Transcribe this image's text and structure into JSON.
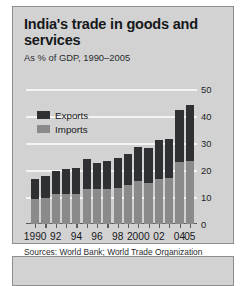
{
  "chart_data": {
    "type": "bar",
    "title": "India's trade in goods and services",
    "subtitle": "As % of GDP, 1990–2005",
    "xlabel": "",
    "ylabel": "",
    "ylim": [
      0,
      50
    ],
    "yticks": [
      0,
      10,
      20,
      30,
      40,
      50
    ],
    "grid": true,
    "stacked": true,
    "legend_position": "upper-left",
    "source": "Sources: World Bank; World Trade Organization",
    "categories": [
      1990,
      1991,
      1992,
      1993,
      1994,
      1995,
      1996,
      1997,
      1998,
      1999,
      2000,
      2001,
      2002,
      2003,
      2004,
      2005
    ],
    "tick_labels": [
      "1990",
      "",
      "92",
      "",
      "94",
      "",
      "96",
      "",
      "98",
      "",
      "2000",
      "",
      "02",
      "",
      "04",
      "05"
    ],
    "series": [
      {
        "name": "Imports",
        "color": "#8a8a8a",
        "values": [
          9.3,
          9.5,
          11.2,
          11.0,
          11.2,
          13.0,
          12.9,
          12.9,
          13.4,
          14.4,
          15.8,
          15.3,
          16.7,
          17.0,
          22.9,
          23.3
        ]
      },
      {
        "name": "Exports",
        "color": "#2e3033",
        "values": [
          7.4,
          8.4,
          8.6,
          9.3,
          9.4,
          10.9,
          9.7,
          10.4,
          10.9,
          11.6,
          12.7,
          13.0,
          14.5,
          14.4,
          19.3,
          20.8
        ]
      }
    ],
    "totals": [
      16.7,
      17.9,
      19.8,
      20.3,
      20.6,
      23.9,
      22.6,
      23.3,
      24.3,
      26.0,
      28.5,
      28.3,
      31.2,
      31.4,
      42.2,
      44.1
    ]
  },
  "legend": {
    "items": [
      {
        "label": "Exports",
        "swatch": "exports-swatch"
      },
      {
        "label": "Imports",
        "swatch": "imports-swatch"
      }
    ]
  }
}
